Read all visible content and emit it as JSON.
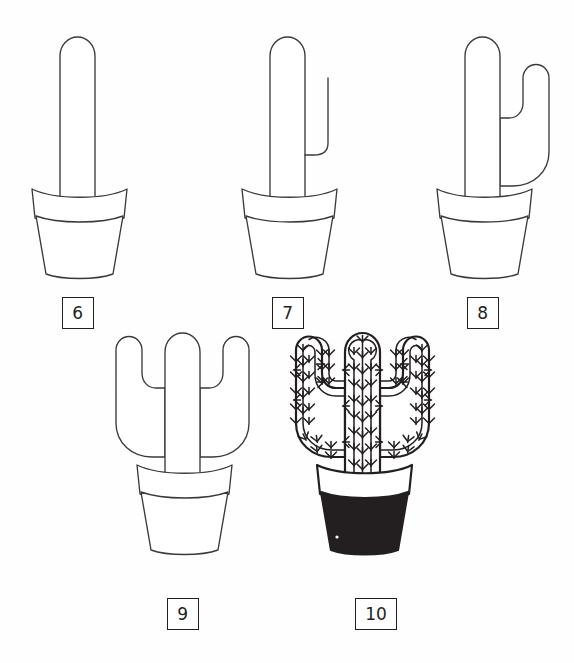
{
  "sheet": {
    "title": "Cactus Drawing Tutorial",
    "width": 574,
    "height": 663,
    "background_color": "#fefefe",
    "ink_color": "#3a3a3c",
    "label_ink_color": "#231f20",
    "fill_color": "#ffffff",
    "pot_dark_fill": "#231f20",
    "panel_count": 5
  },
  "steps": [
    {
      "id": "step-6",
      "label": "6",
      "description": "Tall rounded cactus trunk rising from a terracotta pot with rim",
      "elements": [
        "trunk",
        "pot-rim",
        "pot-body"
      ],
      "arms": 0,
      "spines": false,
      "pot_filled": false
    },
    {
      "id": "step-7",
      "label": "7",
      "description": "Trunk in pot plus a single outer guide line for the right arm",
      "elements": [
        "trunk",
        "right-arm-outline-partial",
        "pot-rim",
        "pot-body"
      ],
      "arms": 0,
      "spines": false,
      "pot_filled": false
    },
    {
      "id": "step-8",
      "label": "8",
      "description": "Trunk in pot with the right arm completed as a curved hook",
      "elements": [
        "trunk",
        "right-arm",
        "pot-rim",
        "pot-body"
      ],
      "arms": 1,
      "spines": false,
      "pot_filled": false
    },
    {
      "id": "step-9",
      "label": "9",
      "description": "Trunk with both left and right arms completed in the pot",
      "elements": [
        "trunk",
        "left-arm",
        "right-arm",
        "pot-rim",
        "pot-body"
      ],
      "arms": 2,
      "spines": false,
      "pot_filled": false
    },
    {
      "id": "step-10",
      "label": "10",
      "description": "Finished cactus with ribs and spines, pot body filled solid dark",
      "elements": [
        "trunk",
        "left-arm",
        "right-arm",
        "ribs",
        "spines",
        "pot-rim",
        "pot-body-filled"
      ],
      "arms": 2,
      "spines": true,
      "pot_filled": true
    }
  ]
}
